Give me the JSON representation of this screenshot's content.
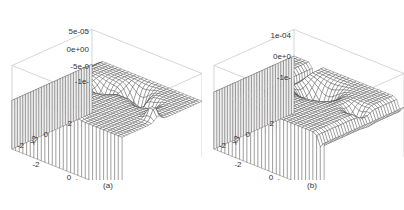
{
  "figure": {
    "captions": [
      "(a)",
      "(b)"
    ]
  },
  "chart_data": [
    {
      "type": "surface",
      "panel_label": "(a)",
      "title": "",
      "xlabel": "x1",
      "ylabel": "x3",
      "zlabel": "",
      "x_ticks": [
        "-2",
        "0",
        "2"
      ],
      "y_ticks": [
        "-2",
        "0",
        "2"
      ],
      "z_ticks": [
        "5e-05",
        "0e+00",
        "-5e-05",
        "-1e-04"
      ],
      "z_ticks_visible_text": [
        "5e-05",
        "0e+00",
        "-5e-0",
        "-1e-"
      ],
      "xlim": [
        -3,
        3
      ],
      "ylim": [
        -3,
        3
      ],
      "zlim": [
        -0.00012,
        5e-05
      ],
      "grid": false,
      "style": "wireframe perspective (persp)"
    },
    {
      "type": "surface",
      "panel_label": "(b)",
      "title": "",
      "xlabel": "x1",
      "ylabel": "x3",
      "zlabel": "",
      "x_ticks": [
        "-2",
        "0",
        "2"
      ],
      "y_ticks": [
        "-2",
        "0",
        "2"
      ],
      "z_ticks": [
        "1e-04",
        "0e+00",
        "-1e-04"
      ],
      "z_ticks_visible_text": [
        "1e-04",
        "0e+0",
        "-1e-"
      ],
      "xlim": [
        -3,
        3
      ],
      "ylim": [
        -3,
        3
      ],
      "zlim": [
        -0.00015,
        0.0001
      ],
      "grid": false,
      "style": "wireframe perspective (persp)"
    }
  ]
}
